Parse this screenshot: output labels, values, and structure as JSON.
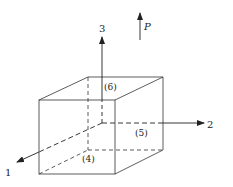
{
  "diagram": {
    "axes": [
      {
        "id": "1",
        "label": "1"
      },
      {
        "id": "2",
        "label": "2"
      },
      {
        "id": "3",
        "label": "3"
      }
    ],
    "load": {
      "label": "P",
      "direction": "up"
    },
    "faces": [
      {
        "label": "(4)"
      },
      {
        "label": "(5)"
      },
      {
        "label": "(6)"
      }
    ],
    "colors": {
      "line": "#222222",
      "background": "#ffffff"
    }
  }
}
